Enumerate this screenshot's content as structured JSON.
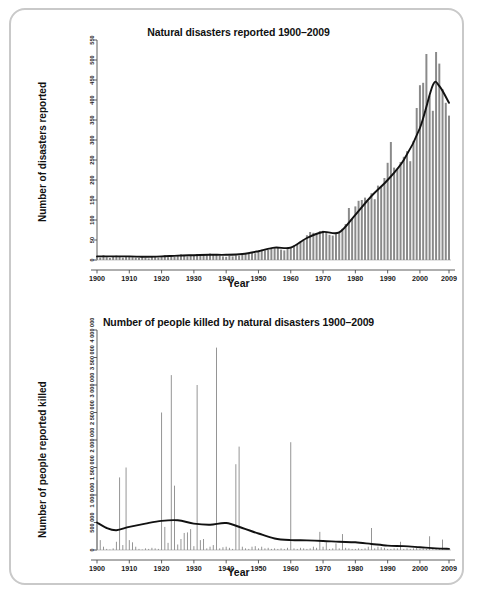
{
  "figure": {
    "border_color": "#c9c9c9",
    "bar_color": "#8a8a8a",
    "line_color": "#111111"
  },
  "chart_data": [
    {
      "id": "natural-disasters-reported",
      "type": "bar",
      "title": "Natural disasters reported 1900–2009",
      "xlabel": "Year",
      "ylabel": "Number of disasters reported",
      "grid": false,
      "legend": "none",
      "xlim": [
        1900,
        2009
      ],
      "ylim": [
        0,
        550
      ],
      "yticks": [
        0,
        50,
        100,
        150,
        200,
        250,
        300,
        350,
        400,
        450,
        500,
        550
      ],
      "ytick_labels": [
        "0",
        "50",
        "100",
        "150",
        "200",
        "250",
        "300",
        "350",
        "400",
        "450",
        "500",
        "550"
      ],
      "xticks": [
        1900,
        1910,
        1920,
        1930,
        1940,
        1950,
        1960,
        1970,
        1980,
        1990,
        2000,
        2009
      ],
      "xtick_labels": [
        "1900",
        "1910",
        "1920",
        "1930",
        "1940",
        "1950",
        "1960",
        "1970",
        "1980",
        "1990",
        "2000",
        "2009"
      ],
      "categories": [
        1900,
        1901,
        1902,
        1903,
        1904,
        1905,
        1906,
        1907,
        1908,
        1909,
        1910,
        1911,
        1912,
        1913,
        1914,
        1915,
        1916,
        1917,
        1918,
        1919,
        1920,
        1921,
        1922,
        1923,
        1924,
        1925,
        1926,
        1927,
        1928,
        1929,
        1930,
        1931,
        1932,
        1933,
        1934,
        1935,
        1936,
        1937,
        1938,
        1939,
        1940,
        1941,
        1942,
        1943,
        1944,
        1945,
        1946,
        1947,
        1948,
        1949,
        1950,
        1951,
        1952,
        1953,
        1954,
        1955,
        1956,
        1957,
        1958,
        1959,
        1960,
        1961,
        1962,
        1963,
        1964,
        1965,
        1966,
        1967,
        1968,
        1969,
        1970,
        1971,
        1972,
        1973,
        1974,
        1975,
        1976,
        1977,
        1978,
        1979,
        1980,
        1981,
        1982,
        1983,
        1984,
        1985,
        1986,
        1987,
        1988,
        1989,
        1990,
        1991,
        1992,
        1993,
        1994,
        1995,
        1996,
        1997,
        1998,
        1999,
        2000,
        2001,
        2002,
        2003,
        2004,
        2005,
        2006,
        2007,
        2008,
        2009
      ],
      "values": [
        8,
        6,
        12,
        7,
        5,
        9,
        11,
        8,
        6,
        10,
        9,
        7,
        6,
        5,
        9,
        6,
        4,
        8,
        10,
        6,
        9,
        12,
        7,
        10,
        8,
        11,
        14,
        12,
        9,
        13,
        11,
        15,
        10,
        13,
        12,
        16,
        14,
        13,
        11,
        9,
        8,
        10,
        9,
        12,
        11,
        14,
        16,
        15,
        18,
        17,
        22,
        26,
        24,
        25,
        28,
        31,
        30,
        26,
        24,
        28,
        33,
        36,
        40,
        46,
        52,
        62,
        70,
        68,
        66,
        72,
        73,
        70,
        63,
        61,
        66,
        70,
        78,
        90,
        130,
        103,
        134,
        148,
        150,
        156,
        147,
        167,
        152,
        186,
        183,
        205,
        243,
        295,
        231,
        228,
        245,
        258,
        272,
        247,
        297,
        380,
        437,
        443,
        515,
        411,
        373,
        520,
        491,
        427,
        393,
        361
      ],
      "trend": {
        "label": "smoothed trend",
        "x": [
          1900,
          1905,
          1910,
          1915,
          1920,
          1925,
          1930,
          1935,
          1940,
          1945,
          1950,
          1955,
          1960,
          1965,
          1970,
          1975,
          1980,
          1985,
          1990,
          1995,
          2000,
          2004,
          2006,
          2009
        ],
        "y": [
          9,
          9,
          9,
          8,
          9,
          11,
          12,
          13,
          13,
          15,
          22,
          31,
          31,
          55,
          70,
          69,
          113,
          160,
          200,
          250,
          330,
          437,
          435,
          393
        ]
      }
    },
    {
      "id": "people-killed-natural-disasters",
      "type": "bar",
      "title": "Number of people killed by natural disasters 1900–2009",
      "xlabel": "Year",
      "ylabel": "Number of people reported killed",
      "grid": false,
      "legend": "none",
      "xlim": [
        1900,
        2009
      ],
      "ylim": [
        0,
        4000000
      ],
      "yticks": [
        0,
        500000,
        1000000,
        1500000,
        2000000,
        2500000,
        3000000,
        3500000,
        4000000
      ],
      "ytick_labels": [
        "0",
        "500 000",
        "1 000 000",
        "1 500 000",
        "2 000 000",
        "2 500 000",
        "3 000 000",
        "3 500 000",
        "4 000 000"
      ],
      "xticks": [
        1900,
        1910,
        1920,
        1930,
        1940,
        1950,
        1960,
        1970,
        1980,
        1990,
        2000,
        2009
      ],
      "xtick_labels": [
        "1900",
        "1910",
        "1920",
        "1930",
        "1940",
        "1950",
        "1960",
        "1970",
        "1980",
        "1990",
        "2000",
        "2009"
      ],
      "categories": [
        1900,
        1901,
        1902,
        1903,
        1904,
        1905,
        1906,
        1907,
        1908,
        1909,
        1910,
        1911,
        1912,
        1913,
        1914,
        1915,
        1916,
        1917,
        1918,
        1919,
        1920,
        1921,
        1922,
        1923,
        1924,
        1925,
        1926,
        1927,
        1928,
        1929,
        1930,
        1931,
        1932,
        1933,
        1934,
        1935,
        1936,
        1937,
        1938,
        1939,
        1940,
        1941,
        1942,
        1943,
        1944,
        1945,
        1946,
        1947,
        1948,
        1949,
        1950,
        1951,
        1952,
        1953,
        1954,
        1955,
        1956,
        1957,
        1958,
        1959,
        1960,
        1961,
        1962,
        1963,
        1964,
        1965,
        1966,
        1967,
        1968,
        1969,
        1970,
        1971,
        1972,
        1973,
        1974,
        1975,
        1976,
        1977,
        1978,
        1979,
        1980,
        1981,
        1982,
        1983,
        1984,
        1985,
        1986,
        1987,
        1988,
        1989,
        1990,
        1991,
        1992,
        1993,
        1994,
        1995,
        1996,
        1997,
        1998,
        1999,
        2000,
        2001,
        2002,
        2003,
        2004,
        2005,
        2006,
        2007,
        2008,
        2009
      ],
      "values": [
        1270000,
        180000,
        60000,
        20000,
        10000,
        30000,
        150000,
        1320000,
        90000,
        1500000,
        180000,
        140000,
        60000,
        20000,
        10000,
        30000,
        20000,
        40000,
        30000,
        20000,
        2500000,
        420000,
        130000,
        3180000,
        1170000,
        100000,
        200000,
        310000,
        320000,
        380000,
        70000,
        3000000,
        180000,
        200000,
        30000,
        60000,
        90000,
        3680000,
        30000,
        50000,
        60000,
        40000,
        20000,
        1560000,
        1880000,
        60000,
        30000,
        20000,
        60000,
        70000,
        30000,
        60000,
        30000,
        40000,
        20000,
        30000,
        20000,
        30000,
        20000,
        40000,
        1960000,
        30000,
        20000,
        40000,
        30000,
        20000,
        30000,
        60000,
        40000,
        330000,
        60000,
        140000,
        20000,
        30000,
        120000,
        30000,
        290000,
        40000,
        30000,
        20000,
        20000,
        30000,
        20000,
        30000,
        60000,
        400000,
        30000,
        60000,
        50000,
        40000,
        20000,
        20000,
        30000,
        30000,
        150000,
        20000,
        30000,
        20000,
        30000,
        40000,
        20000,
        30000,
        20000,
        250000,
        30000,
        20000,
        30000,
        190000
      ],
      "trend": {
        "label": "smoothed trend",
        "x": [
          1900,
          1903,
          1906,
          1910,
          1915,
          1920,
          1925,
          1930,
          1935,
          1940,
          1945,
          1950,
          1955,
          1960,
          1965,
          1970,
          1975,
          1980,
          1985,
          1990,
          1995,
          2000,
          2005,
          2009
        ],
        "y": [
          500000,
          400000,
          360000,
          420000,
          480000,
          530000,
          540000,
          480000,
          460000,
          490000,
          400000,
          300000,
          210000,
          180000,
          175000,
          165000,
          150000,
          140000,
          110000,
          80000,
          70000,
          50000,
          30000,
          20000
        ]
      }
    }
  ]
}
